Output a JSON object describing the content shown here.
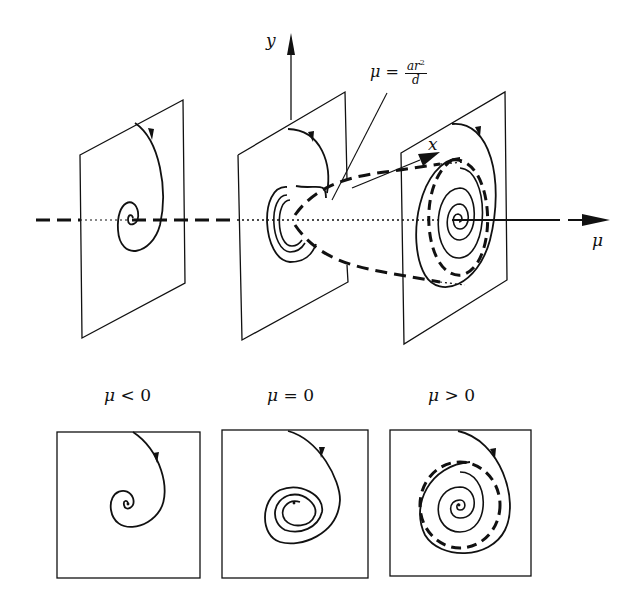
{
  "figure": {
    "axes": {
      "y_label": "y",
      "x_label": "x",
      "mu_label": "μ"
    },
    "annotation": {
      "lhs": "μ =",
      "numerator": "ar",
      "numerator_exp": "2",
      "denominator": "d"
    },
    "captions": [
      {
        "var": "μ",
        "rel": "<",
        "val": "0"
      },
      {
        "var": "μ",
        "rel": "=",
        "val": "0"
      },
      {
        "var": "μ",
        "rel": ">",
        "val": "0"
      }
    ],
    "panels": [
      {
        "regime": "mu_negative",
        "portrait": "stable spiral converging to fixed point"
      },
      {
        "regime": "mu_zero",
        "portrait": "slow spiral toward center (weakly stable)"
      },
      {
        "regime": "mu_positive",
        "portrait": "unstable spiral approaching stable limit cycle (dashed)"
      }
    ],
    "colors": {
      "ink": "#111111",
      "background": "#ffffff"
    }
  }
}
